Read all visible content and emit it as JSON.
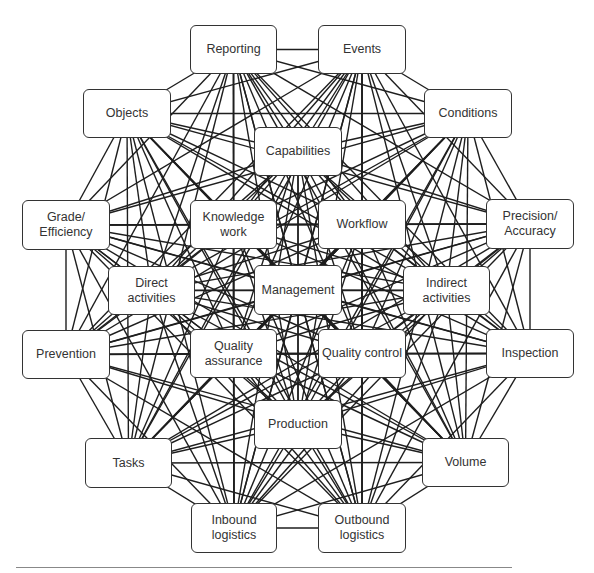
{
  "diagram": {
    "type": "network",
    "nodes": [
      {
        "id": "reporting",
        "label": "Reporting",
        "x": 190,
        "y": 25,
        "w": 87,
        "h": 49
      },
      {
        "id": "events",
        "label": "Events",
        "x": 318,
        "y": 25,
        "w": 88,
        "h": 49
      },
      {
        "id": "objects",
        "label": "Objects",
        "x": 83,
        "y": 89,
        "w": 88,
        "h": 49
      },
      {
        "id": "conditions",
        "label": "Conditions",
        "x": 424,
        "y": 89,
        "w": 88,
        "h": 49
      },
      {
        "id": "capabilities",
        "label": "Capabilities",
        "x": 254,
        "y": 127,
        "w": 88,
        "h": 49
      },
      {
        "id": "grade-efficiency",
        "label": "Grade/\nEfficiency",
        "x": 22,
        "y": 200,
        "w": 88,
        "h": 50
      },
      {
        "id": "knowledge-work",
        "label": "Knowledge\nwork",
        "x": 190,
        "y": 200,
        "w": 87,
        "h": 49
      },
      {
        "id": "workflow",
        "label": "Workflow",
        "x": 318,
        "y": 200,
        "w": 88,
        "h": 49
      },
      {
        "id": "precision-accuracy",
        "label": "Precision/\nAccuracy",
        "x": 486,
        "y": 199,
        "w": 88,
        "h": 50
      },
      {
        "id": "direct-activities",
        "label": "Direct\nactivities",
        "x": 108,
        "y": 266,
        "w": 87,
        "h": 49
      },
      {
        "id": "management",
        "label": "Management",
        "x": 254,
        "y": 265,
        "w": 88,
        "h": 50
      },
      {
        "id": "indirect-activities",
        "label": "Indirect\nactivities",
        "x": 403,
        "y": 266,
        "w": 87,
        "h": 49
      },
      {
        "id": "prevention",
        "label": "Prevention",
        "x": 22,
        "y": 330,
        "w": 88,
        "h": 49
      },
      {
        "id": "quality-assurance",
        "label": "Quality\nassurance",
        "x": 190,
        "y": 329,
        "w": 87,
        "h": 49
      },
      {
        "id": "quality-control",
        "label": "Quality control",
        "x": 318,
        "y": 329,
        "w": 88,
        "h": 49
      },
      {
        "id": "inspection",
        "label": "Inspection",
        "x": 486,
        "y": 329,
        "w": 88,
        "h": 49
      },
      {
        "id": "production",
        "label": "Production",
        "x": 254,
        "y": 400,
        "w": 88,
        "h": 49
      },
      {
        "id": "tasks",
        "label": "Tasks",
        "x": 85,
        "y": 438,
        "w": 87,
        "h": 50
      },
      {
        "id": "volume",
        "label": "Volume",
        "x": 422,
        "y": 438,
        "w": 87,
        "h": 49
      },
      {
        "id": "inbound-logistics",
        "label": "Inbound\nlogistics",
        "x": 191,
        "y": 503,
        "w": 86,
        "h": 50
      },
      {
        "id": "outbound-logistics",
        "label": "Outbound\nlogistics",
        "x": 318,
        "y": 503,
        "w": 88,
        "h": 50
      }
    ],
    "edges": "all-pairs",
    "colors": {
      "line": "#1e1e1e",
      "box_border": "#333333",
      "text": "#333333",
      "background": "#ffffff",
      "rule": "#888888"
    }
  }
}
